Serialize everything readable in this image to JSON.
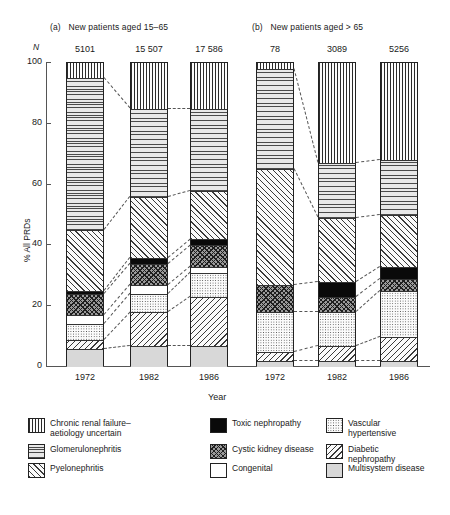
{
  "chart_data": {
    "type": "bar",
    "subtype": "stacked-percentage",
    "title": "",
    "xlabel": "Year",
    "ylabel": "% All PRDs",
    "ylim": [
      0,
      100
    ],
    "yticks": [
      0,
      20,
      40,
      60,
      80,
      100
    ],
    "grid": false,
    "legend_position": "bottom",
    "n_axis_label": "N",
    "panels": [
      {
        "tag": "(a)",
        "title": "New patients aged 15–65",
        "categories": [
          "1972",
          "1982",
          "1986"
        ],
        "n_values": [
          "5101",
          "15 507",
          "17 586"
        ],
        "series": [
          {
            "name": "Chronic renal failure–aetiology uncertain",
            "values": [
              5,
              15,
              15
            ]
          },
          {
            "name": "Glomerulonephritis",
            "values": [
              50,
              29,
              27
            ]
          },
          {
            "name": "Pyelonephritis",
            "values": [
              20,
              20,
              16
            ]
          },
          {
            "name": "Toxic nephropathy",
            "values": [
              1,
              2,
              2
            ]
          },
          {
            "name": "Cystic kidney disease",
            "values": [
              7,
              7,
              7
            ]
          },
          {
            "name": "Congenital",
            "values": [
              3,
              3,
              2
            ]
          },
          {
            "name": "Vascular hypertensive",
            "values": [
              5,
              6,
              8
            ]
          },
          {
            "name": "Diabetic nephropathy",
            "values": [
              3,
              11,
              16
            ]
          },
          {
            "name": "Multisystem disease",
            "values": [
              6,
              7,
              7
            ]
          }
        ]
      },
      {
        "tag": "(b)",
        "title": "New patients aged > 65",
        "categories": [
          "1972",
          "1982",
          "1986"
        ],
        "n_values": [
          "78",
          "3089",
          "5256"
        ],
        "series": [
          {
            "name": "Chronic renal failure–aetiology uncertain",
            "values": [
              2,
              33,
              32
            ]
          },
          {
            "name": "Glomerulonephritis",
            "values": [
              33,
              18,
              18
            ]
          },
          {
            "name": "Pyelonephritis",
            "values": [
              38,
              21,
              17
            ]
          },
          {
            "name": "Toxic nephropathy",
            "values": [
              0,
              5,
              4
            ]
          },
          {
            "name": "Cystic kidney disease",
            "values": [
              9,
              5,
              4
            ]
          },
          {
            "name": "Congenital",
            "values": [
              0,
              0,
              0
            ]
          },
          {
            "name": "Vascular hypertensive",
            "values": [
              13,
              11,
              15
            ]
          },
          {
            "name": "Diabetic nephropathy",
            "values": [
              3,
              5,
              8
            ]
          },
          {
            "name": "Multisystem disease",
            "values": [
              2,
              2,
              2
            ]
          }
        ]
      }
    ],
    "legend": [
      {
        "label": "Chronic renal failure–\naetiology uncertain",
        "pattern": "vertical-lines"
      },
      {
        "label": "Glomerulonephritis",
        "pattern": "horizontal-lines"
      },
      {
        "label": "Pyelonephritis",
        "pattern": "diagonal-lines-left"
      },
      {
        "label": "Toxic nephropathy",
        "pattern": "solid-black"
      },
      {
        "label": "Cystic kidney disease",
        "pattern": "crosshatch"
      },
      {
        "label": "Congenital",
        "pattern": "white"
      },
      {
        "label": "Vascular hypertensive",
        "pattern": "stipple-dots"
      },
      {
        "label": "Diabetic nephropathy",
        "pattern": "diagonal-lines-right"
      },
      {
        "label": "Multisystem disease",
        "pattern": "solid-grey"
      }
    ]
  }
}
